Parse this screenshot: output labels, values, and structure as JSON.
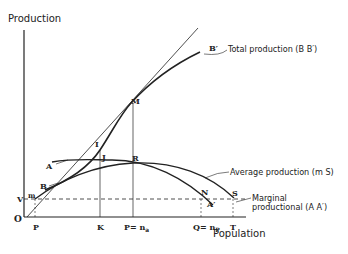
{
  "diagram": {
    "axes": {
      "y_label": "Production",
      "x_label": "Population",
      "origin": "O"
    },
    "curves": {
      "total": {
        "caption": "Total production (B  B′)",
        "start": "B",
        "end": "B′"
      },
      "average": {
        "caption": "Average production (m  S)",
        "start": "m",
        "end": "S"
      },
      "marginal": {
        "caption_line1": "Marginal",
        "caption_line2": "productional (A  A′)",
        "start": "A",
        "end": "A′"
      }
    },
    "points": {
      "M": "M",
      "I": "I",
      "J": "J",
      "R": "R",
      "N": "N",
      "S": "S",
      "A_prime": "A′",
      "V": "V",
      "m": "m",
      "A": "A",
      "B": "B",
      "B_prime": "B′"
    },
    "x_ticks": {
      "p": "P",
      "K": "K",
      "P_main": "P",
      "P_eq": "= n",
      "P_sub": "a",
      "Q_main": "Q",
      "Q_eq": "= n",
      "Q_sub": "P",
      "T": "T"
    },
    "colors": {
      "ink": "#222222",
      "background": "#ffffff"
    }
  }
}
